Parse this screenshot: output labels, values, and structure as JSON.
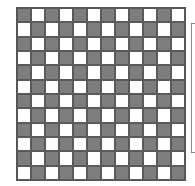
{
  "board": {
    "rows": 12,
    "cols": 12,
    "top_left_color": "dark",
    "colors": {
      "dark": "#7d7d7d",
      "light": "#ffffff",
      "grid_line": "#5a5a5a"
    }
  },
  "side_panel": {
    "visible_edge": true
  }
}
